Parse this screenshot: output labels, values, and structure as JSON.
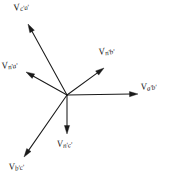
{
  "figure": {
    "background_color": "#ffffff",
    "ink_color": "#1a1a1a",
    "width": 175,
    "height": 182,
    "origin": {
      "x": 67,
      "y": 95
    }
  },
  "chart_data": {
    "type": "scatter",
    "subtype": "phasor-vector-diagram",
    "title": "",
    "xlabel": "",
    "ylabel": "",
    "grid": false,
    "legend": "none",
    "axis_shown": false,
    "origin": {
      "x": 67,
      "y": 95
    },
    "xlim": [
      0,
      175
    ],
    "ylim": [
      0,
      182
    ],
    "note": "Six voltage phasors drawn from a common origin; angles measured counter-clockwise from the positive x-axis (screen coords, y down).",
    "vectors": [
      {
        "name": "V_c'a'",
        "label": "V",
        "subscript": "c'a'",
        "tip": {
          "x": 28,
          "y": 24
        },
        "dx": -39,
        "dy": -71,
        "length": 81,
        "angle_deg": 118.8,
        "label_position": {
          "x": 14,
          "y": 4
        },
        "label_rotation_deg": -12
      },
      {
        "name": "V_n'a'",
        "label": "V",
        "subscript": "n'a'",
        "tip": {
          "x": 26,
          "y": 72
        },
        "dx": -41,
        "dy": -23,
        "length": 47,
        "angle_deg": 150.7,
        "label_position": {
          "x": 2,
          "y": 62
        },
        "label_rotation_deg": -10
      },
      {
        "name": "V_n'b'",
        "label": "V",
        "subscript": "n'b'",
        "tip": {
          "x": 104,
          "y": 68
        },
        "dx": 37,
        "dy": -27,
        "length": 46,
        "angle_deg": 36.1,
        "label_position": {
          "x": 99,
          "y": 48
        },
        "label_rotation_deg": -10
      },
      {
        "name": "V_a'b'",
        "label": "V",
        "subscript": "a'b'",
        "tip": {
          "x": 138,
          "y": 94
        },
        "dx": 71,
        "dy": -1,
        "length": 71,
        "angle_deg": 0.8,
        "label_position": {
          "x": 141,
          "y": 83
        },
        "label_rotation_deg": -8
      },
      {
        "name": "V_n'c'",
        "label": "V",
        "subscript": "n'c'",
        "tip": {
          "x": 67,
          "y": 134
        },
        "dx": 0,
        "dy": 39,
        "length": 39,
        "angle_deg": -90,
        "label_position": {
          "x": 57,
          "y": 140
        },
        "label_rotation_deg": -6
      },
      {
        "name": "V_b'c'",
        "label": "V",
        "subscript": "b'c'",
        "tip": {
          "x": 24,
          "y": 157
        },
        "dx": -43,
        "dy": 62,
        "length": 75,
        "angle_deg": -124.7,
        "label_position": {
          "x": 9,
          "y": 163
        },
        "label_rotation_deg": -8
      }
    ]
  }
}
